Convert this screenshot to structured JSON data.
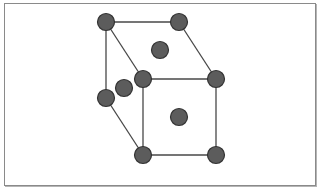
{
  "diagram": {
    "type": "crystal-lattice",
    "structure": "face-centered cubic unit cell",
    "colors": {
      "atom_fill": "#5c5c5c",
      "atom_stroke": "#333333",
      "edge": "#474747",
      "frame_border": "#8a8a8a",
      "background": "#ffffff"
    },
    "atom_radius": 8.5,
    "atoms": [
      {
        "id": "back-top-left",
        "role": "corner",
        "x": 106,
        "y": 22
      },
      {
        "id": "back-top-right",
        "role": "corner",
        "x": 179,
        "y": 22
      },
      {
        "id": "back-bottom-left",
        "role": "corner",
        "x": 106,
        "y": 98
      },
      {
        "id": "front-top-left",
        "role": "corner",
        "x": 143,
        "y": 79
      },
      {
        "id": "front-top-right",
        "role": "corner",
        "x": 216,
        "y": 79
      },
      {
        "id": "front-bottom-left",
        "role": "corner",
        "x": 143,
        "y": 155
      },
      {
        "id": "front-bottom-right",
        "role": "corner",
        "x": 216,
        "y": 155
      },
      {
        "id": "top-face-center",
        "role": "face-center",
        "x": 160,
        "y": 50
      },
      {
        "id": "left-face-center",
        "role": "face-center",
        "x": 124,
        "y": 88
      },
      {
        "id": "front-face-center",
        "role": "face-center",
        "x": 179,
        "y": 117
      }
    ],
    "edges": [
      {
        "from": "back-top-left",
        "to": "back-top-right"
      },
      {
        "from": "back-top-left",
        "to": "back-bottom-left"
      },
      {
        "from": "back-top-left",
        "to": "front-top-left"
      },
      {
        "from": "back-top-right",
        "to": "front-top-right"
      },
      {
        "from": "back-bottom-left",
        "to": "front-bottom-left"
      },
      {
        "from": "front-top-left",
        "to": "front-top-right"
      },
      {
        "from": "front-top-right",
        "to": "front-bottom-right"
      },
      {
        "from": "front-bottom-right",
        "to": "front-bottom-left"
      },
      {
        "from": "front-bottom-left",
        "to": "front-top-left"
      }
    ]
  }
}
